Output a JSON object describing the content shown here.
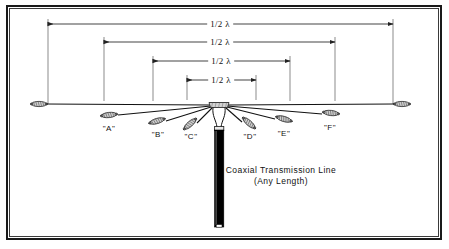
{
  "figure": {
    "frame": {
      "stroke": "#1a1a1a",
      "background": "#ffffff"
    }
  },
  "dimensions": [
    {
      "id": "dim-1",
      "label": "1/2 λ",
      "x1": 48,
      "x2": 393,
      "y": 24,
      "text_x": 220
    },
    {
      "id": "dim-2",
      "label": "1/2 λ",
      "x1": 104,
      "x2": 335,
      "y": 42,
      "text_x": 220
    },
    {
      "id": "dim-3",
      "label": "1/2 λ",
      "x1": 153,
      "x2": 290,
      "y": 61,
      "text_x": 221
    },
    {
      "id": "dim-4",
      "label": "1/2 λ",
      "x1": 187,
      "x2": 256,
      "y": 80,
      "text_x": 221
    }
  ],
  "elements": [
    {
      "id": "A",
      "label": "\"A\"",
      "label_x": 109,
      "label_y": 124
    },
    {
      "id": "B",
      "label": "\"B\"",
      "label_x": 158,
      "label_y": 130
    },
    {
      "id": "C",
      "label": "\"C\"",
      "label_x": 191,
      "label_y": 132
    },
    {
      "id": "D",
      "label": "\"D\"",
      "label_x": 250,
      "label_y": 132
    },
    {
      "id": "E",
      "label": "\"E\"",
      "label_x": 284,
      "label_y": 129
    },
    {
      "id": "F",
      "label": "\"F\"",
      "label_x": 330,
      "label_y": 123
    }
  ],
  "feedline": {
    "caption_line1": "Coaxial Transmission Line",
    "caption_line2": "(Any Length)",
    "caption_x": 281,
    "caption_y1": 164,
    "caption_y2": 175,
    "color": "#000000"
  },
  "colors": {
    "wire": "#111111",
    "insulator_fill": "#c8c8c8",
    "insulator_stroke": "#2b2b2b",
    "dimension_line": "#222222"
  }
}
